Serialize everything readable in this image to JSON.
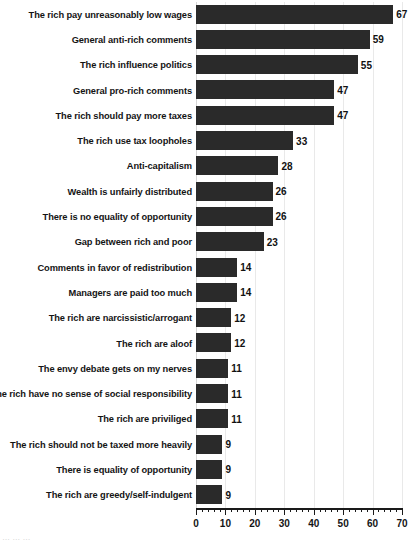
{
  "chart_data": {
    "type": "bar",
    "orientation": "horizontal",
    "title": "",
    "subtitle": "",
    "xlabel": "",
    "ylabel": "",
    "xlim": [
      0,
      70
    ],
    "grid": true,
    "legend": false,
    "x_ticks": [
      0,
      10,
      20,
      30,
      40,
      50,
      60,
      70
    ],
    "x_tick_labels": [
      "0",
      "10",
      "20",
      "30",
      "40",
      "50",
      "60",
      "70"
    ],
    "minor_tick_step": 2,
    "bar_color": "#2a2a2a",
    "value_label_color": "#111111",
    "gridline_color": "#e9e9e9",
    "categories": [
      "The rich pay unreasonably low wages",
      "General anti-rich comments",
      "The rich influence politics",
      "General pro-rich comments",
      "The rich should pay more taxes",
      "The rich use tax loopholes",
      "Anti-capitalism",
      "Wealth is unfairly distributed",
      "There is no equality of opportunity",
      "Gap between rich and poor",
      "Comments in favor of redistribution",
      "Managers are paid too much",
      "The rich are narcissistic/arrogant",
      "The rich are aloof",
      "The envy debate gets on my nerves",
      "The rich have no sense of social responsibility",
      "The rich are priviliged",
      "The rich should not be taxed more heavily",
      "There is equality of opportunity",
      "The rich are greedy/self-indulgent"
    ],
    "values": [
      67,
      59,
      55,
      47,
      47,
      33,
      28,
      26,
      26,
      23,
      14,
      14,
      12,
      12,
      11,
      11,
      11,
      9,
      9,
      9
    ],
    "value_labels": [
      "67",
      "59",
      "55",
      "47",
      "47",
      "33",
      "28",
      "26",
      "26",
      "23",
      "14",
      "14",
      "12",
      "12",
      "11",
      "11",
      "11",
      "9",
      "9",
      "9"
    ]
  },
  "caption": {
    "text": "… … …"
  }
}
